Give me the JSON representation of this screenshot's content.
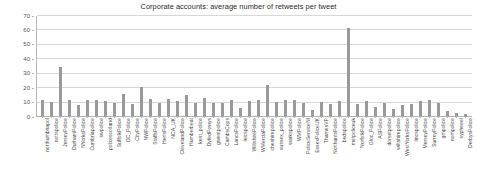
{
  "chart_data": {
    "type": "bar",
    "title": "Corporate accounts: average number of retweets per tweet",
    "xlabel": "",
    "ylabel": "",
    "ylim": [
      0,
      70
    ],
    "yticks": [
      0,
      10,
      20,
      30,
      40,
      50,
      60,
      70
    ],
    "grid": true,
    "legend": false,
    "bar_color": "#9a9a9a",
    "categories": [
      "northumbriapol",
      "nottspolice",
      "JerseyPolice",
      "DurhamPolice",
      "NYorksPolice",
      "Cumbriapolice",
      "swpolice",
      "policescotland",
      "SuffolkPolice",
      "DC_Police",
      "CityPolice",
      "NWPolice",
      "StaffsPolice",
      "HertsPolice",
      "NCA_UK",
      "ClevelandPolice",
      "Humberbeat",
      "kent_police",
      "DyfedPowys",
      "gwentpolice",
      "CambsCops",
      "LancsPolice",
      "leicspolice",
      "WiltshirePolice",
      "WMerciaPolice",
      "cheshirepolice",
      "sussex_police",
      "warkspolice",
      "WMPolice",
      "PoliceServiceNI",
      "EssexPoliceUK",
      "ThamesVP",
      "NorthantsPolice",
      "bedspolice",
      "metpoliceuk",
      "NorfolkPolice",
      "Gloc_Police",
      "ASPolice",
      "dorsetpolice",
      "wiltshirepolice",
      "WestYorksPolice",
      "lincspolice",
      "MerseyPolice",
      "SurreyPolice",
      "gmpolice",
      "nompolice",
      "sypheeel",
      "DerbysPolice"
    ],
    "values": [
      11.5,
      10.5,
      35.0,
      11.5,
      8.0,
      12.0,
      11.5,
      11.0,
      9.5,
      16.0,
      9.0,
      20.5,
      12.5,
      10.0,
      12.5,
      11.0,
      15.5,
      10.0,
      13.0,
      9.5,
      10.0,
      12.0,
      6.0,
      11.0,
      11.5,
      22.0,
      10.5,
      12.0,
      12.0,
      9.5,
      5.0,
      10.5,
      9.0,
      11.0,
      62.0,
      9.0,
      11.0,
      7.0,
      10.0,
      5.5,
      8.5,
      9.0,
      11.0,
      12.0,
      10.0,
      4.0,
      3.0,
      2.0
    ]
  }
}
